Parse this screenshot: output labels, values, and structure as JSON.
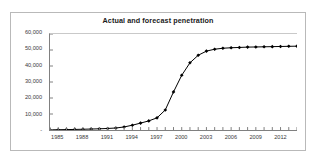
{
  "chart_data": {
    "type": "line",
    "title": "Actual and forecast penetration",
    "xlabel": "",
    "ylabel": "",
    "grid": false,
    "legend": false,
    "marker": "filled-diamond",
    "line_color": "#000000",
    "marker_color": "#000000",
    "xlim": [
      1984,
      2014
    ],
    "ylim": [
      0,
      60000
    ],
    "ytick_labels": [
      "60,000",
      "50,000",
      "40,000",
      "30,000",
      "20,000",
      "10,000",
      "-"
    ],
    "ytick_values": [
      60000,
      50000,
      40000,
      30000,
      20000,
      10000,
      0
    ],
    "xtick_labels": [
      "1985",
      "1988",
      "1991",
      "1994",
      "1997",
      "2000",
      "2003",
      "2006",
      "2009",
      "2012"
    ],
    "xtick_values": [
      1985,
      1988,
      1991,
      1994,
      1997,
      2000,
      2003,
      2006,
      2009,
      2012
    ],
    "x": [
      1984,
      1985,
      1986,
      1987,
      1988,
      1989,
      1990,
      1991,
      1992,
      1993,
      1994,
      1995,
      1996,
      1997,
      1998,
      1999,
      2000,
      2001,
      2002,
      2003,
      2004,
      2005,
      2006,
      2007,
      2008,
      2009,
      2010,
      2011,
      2012,
      2013,
      2014
    ],
    "values": [
      100,
      180,
      260,
      360,
      470,
      600,
      760,
      960,
      1250,
      1900,
      3000,
      4300,
      5700,
      7600,
      12500,
      23800,
      34200,
      42000,
      46700,
      49300,
      50500,
      51100,
      51400,
      51600,
      51800,
      51900,
      52000,
      52100,
      52200,
      52300,
      52400
    ],
    "series": [
      {
        "name": "Actual and forecast penetration",
        "values": [
          100,
          180,
          260,
          360,
          470,
          600,
          760,
          960,
          1250,
          1900,
          3000,
          4300,
          5700,
          7600,
          12500,
          23800,
          34200,
          42000,
          46700,
          49300,
          50500,
          51100,
          51400,
          51600,
          51800,
          51900,
          52000,
          52100,
          52200,
          52300,
          52400
        ]
      }
    ]
  }
}
